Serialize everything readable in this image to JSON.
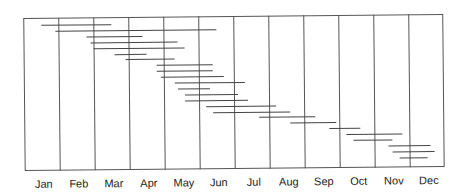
{
  "chart_data": {
    "type": "gantt",
    "title": "",
    "xlabel": "",
    "ylabel": "",
    "categories": [
      "Jan",
      "Feb",
      "Mar",
      "Apr",
      "May",
      "Jun",
      "Jul",
      "Aug",
      "Sep",
      "Oct",
      "Nov",
      "Dec"
    ],
    "xlim": [
      0,
      12
    ],
    "grid": {
      "vertical": true,
      "horizontal": false
    },
    "legend": null,
    "units": "months (0 = start of Jan, 12 = end of Dec)",
    "series": [
      {
        "name": "task-1",
        "start": 0.5,
        "end": 2.5
      },
      {
        "name": "task-2",
        "start": 0.9,
        "end": 5.5
      },
      {
        "name": "task-3",
        "start": 1.8,
        "end": 3.4
      },
      {
        "name": "task-4",
        "start": 1.9,
        "end": 4.4
      },
      {
        "name": "task-5",
        "start": 2.0,
        "end": 4.6
      },
      {
        "name": "task-6",
        "start": 2.6,
        "end": 3.5
      },
      {
        "name": "task-7",
        "start": 2.9,
        "end": 4.3
      },
      {
        "name": "task-8",
        "start": 3.8,
        "end": 5.4
      },
      {
        "name": "task-9",
        "start": 3.8,
        "end": 5.4
      },
      {
        "name": "task-10",
        "start": 3.9,
        "end": 5.7
      },
      {
        "name": "task-11",
        "start": 4.3,
        "end": 6.3
      },
      {
        "name": "task-12",
        "start": 4.4,
        "end": 5.3
      },
      {
        "name": "task-13",
        "start": 4.6,
        "end": 6.1
      },
      {
        "name": "task-14",
        "start": 4.6,
        "end": 6.4
      },
      {
        "name": "task-15",
        "start": 5.2,
        "end": 7.2
      },
      {
        "name": "task-16",
        "start": 5.4,
        "end": 7.6
      },
      {
        "name": "task-17",
        "start": 6.7,
        "end": 8.3
      },
      {
        "name": "task-18",
        "start": 7.6,
        "end": 8.9
      },
      {
        "name": "task-19",
        "start": 8.7,
        "end": 9.6
      },
      {
        "name": "task-20",
        "start": 9.2,
        "end": 10.8
      },
      {
        "name": "task-21",
        "start": 9.4,
        "end": 10.5
      },
      {
        "name": "task-22",
        "start": 10.4,
        "end": 11.6
      },
      {
        "name": "task-23",
        "start": 10.5,
        "end": 11.7
      },
      {
        "name": "task-24",
        "start": 10.7,
        "end": 11.5
      }
    ]
  }
}
